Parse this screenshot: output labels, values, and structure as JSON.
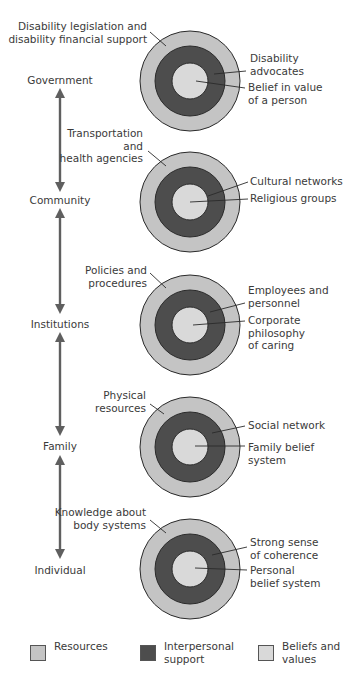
{
  "colors": {
    "resources": "#c4c4c4",
    "interpersonal": "#4d4d4d",
    "beliefs": "#d9d9d9",
    "outline": "#2a2a2a",
    "arrow": "#5f5f5f",
    "leader": "#2a2a2a"
  },
  "levels": [
    {
      "label": "Government",
      "y": 84
    },
    {
      "label": "Community",
      "y": 204
    },
    {
      "label": "Institutions",
      "y": 328
    },
    {
      "label": "Family",
      "y": 450
    },
    {
      "label": "Individual",
      "y": 574
    }
  ],
  "arrows": [
    {
      "top": 89,
      "bottom": 191
    },
    {
      "top": 209,
      "bottom": 313
    },
    {
      "top": 333,
      "bottom": 435
    },
    {
      "top": 456,
      "bottom": 558
    }
  ],
  "circles": [
    {
      "cx": 190,
      "cy": 81,
      "resources": {
        "lines": [
          "Disability legislation and",
          "disability financial support"
        ],
        "x": 147,
        "y": 30,
        "leader": [
          150,
          32,
          166,
          46
        ]
      },
      "interpersonal": {
        "lines": [
          "Disability",
          "advocates"
        ],
        "x": 250,
        "y": 62,
        "leader": [
          214,
          74,
          246,
          71
        ]
      },
      "beliefs": {
        "lines": [
          "Belief in value",
          "of a person"
        ],
        "x": 248,
        "y": 91,
        "leader": [
          196,
          81,
          245,
          88
        ]
      }
    },
    {
      "cx": 190,
      "cy": 202,
      "resources": {
        "lines": [
          "Transportation",
          "and",
          "health agencies"
        ],
        "x": 143,
        "y": 137,
        "leader": [
          148,
          151,
          166,
          166
        ]
      },
      "interpersonal": {
        "lines": [
          "Cultural networks"
        ],
        "x": 250,
        "y": 185,
        "leader": [
          208,
          196,
          248,
          182
        ]
      },
      "beliefs": {
        "lines": [
          "Religious groups"
        ],
        "x": 250,
        "y": 202,
        "leader": [
          190,
          202,
          248,
          199
        ]
      }
    },
    {
      "cx": 190,
      "cy": 325,
      "resources": {
        "lines": [
          "Policies and",
          "procedures"
        ],
        "x": 147,
        "y": 274,
        "leader": [
          150,
          273,
          166,
          288
        ]
      },
      "interpersonal": {
        "lines": [
          "Employees and",
          "personnel"
        ],
        "x": 248,
        "y": 294,
        "leader": [
          210,
          312,
          245,
          303
        ]
      },
      "beliefs": {
        "lines": [
          "Corporate",
          "philosophy",
          "of caring"
        ],
        "x": 248,
        "y": 324,
        "leader": [
          193,
          325,
          245,
          321
        ]
      }
    },
    {
      "cx": 190,
      "cy": 447,
      "resources": {
        "lines": [
          "Physical",
          "resources"
        ],
        "x": 146,
        "y": 399,
        "leader": [
          150,
          404,
          164,
          414
        ]
      },
      "interpersonal": {
        "lines": [
          "Social network"
        ],
        "x": 248,
        "y": 429,
        "leader": [
          212,
          433,
          245,
          426
        ]
      },
      "beliefs": {
        "lines": [
          "Family belief",
          "system"
        ],
        "x": 248,
        "y": 451,
        "leader": [
          195,
          446,
          245,
          446
        ]
      }
    },
    {
      "cx": 190,
      "cy": 569,
      "resources": {
        "lines": [
          "Knowledge about",
          "body systems"
        ],
        "x": 146,
        "y": 516,
        "leader": [
          150,
          520,
          166,
          533
        ]
      },
      "interpersonal": {
        "lines": [
          "Strong sense",
          "of coherence"
        ],
        "x": 250,
        "y": 546,
        "leader": [
          212,
          555,
          247,
          547
        ]
      },
      "beliefs": {
        "lines": [
          "Personal",
          "belief system"
        ],
        "x": 250,
        "y": 574,
        "leader": [
          195,
          568,
          247,
          570
        ]
      }
    }
  ],
  "radii": {
    "outer": 50,
    "middle": 35,
    "inner": 18
  },
  "legend": {
    "items": [
      {
        "key": "resources",
        "label": "Resources",
        "x": 30
      },
      {
        "key": "interpersonal",
        "label": "Interpersonal\nsupport",
        "x": 140
      },
      {
        "key": "beliefs",
        "label": "Beliefs and\nvalues",
        "x": 258
      }
    ]
  }
}
